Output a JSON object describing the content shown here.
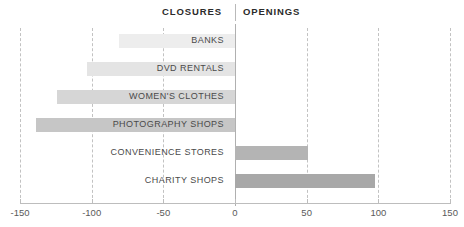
{
  "header": {
    "left_label": "CLOSURES",
    "right_label": "OPENINGS"
  },
  "colors": {
    "bar_lightest": "#ededed",
    "bar_light": "#e4e4e4",
    "bar_mid_light": "#d6d6d6",
    "bar_mid": "#c6c6c6",
    "bar_dark": "#b4b4b4",
    "bar_darkest": "#a8a8a8",
    "gridline": "#c2c2c2",
    "axis": "#bdbdbd",
    "text": "#4a4a4a",
    "header_text": "#2b2b2b"
  },
  "chart_data": {
    "type": "bar",
    "orientation": "horizontal",
    "title": "",
    "subtitle": "",
    "xlabel": "",
    "ylabel": "",
    "xlim": [
      -150,
      150
    ],
    "xticks": [
      -150,
      -100,
      -50,
      0,
      50,
      100,
      150
    ],
    "xtick_labels": [
      "-150",
      "-100",
      "-50",
      "0",
      "50",
      "100",
      "150"
    ],
    "grid": true,
    "legend": [
      "CLOSURES",
      "OPENINGS"
    ],
    "legend_position": "top-center",
    "categories": [
      "BANKS",
      "DVD RENTALS",
      "WOMEN'S CLOTHES",
      "PHOTOGRAPHY SHOPS",
      "CONVENIENCE STORES",
      "CHARITY SHOPS"
    ],
    "values": [
      -81,
      -103,
      -124,
      -139,
      51,
      98
    ],
    "bars": [
      {
        "category": "BANKS",
        "value": -81,
        "color": "#ededed",
        "side": "closures"
      },
      {
        "category": "DVD RENTALS",
        "value": -103,
        "color": "#e4e4e4",
        "side": "closures"
      },
      {
        "category": "WOMEN'S CLOTHES",
        "value": -124,
        "color": "#d6d6d6",
        "side": "closures"
      },
      {
        "category": "PHOTOGRAPHY SHOPS",
        "value": -139,
        "color": "#c6c6c6",
        "side": "closures"
      },
      {
        "category": "CONVENIENCE STORES",
        "value": 51,
        "color": "#b4b4b4",
        "side": "openings"
      },
      {
        "category": "CHARITY SHOPS",
        "value": 98,
        "color": "#a8a8a8",
        "side": "openings"
      }
    ]
  }
}
